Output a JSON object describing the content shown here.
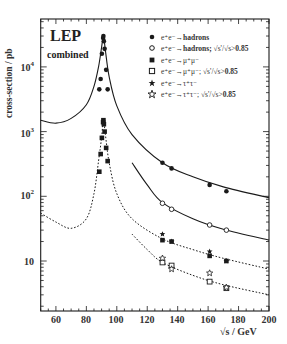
{
  "chart_data": {
    "type": "scatter",
    "title": "LEP",
    "subtitle": "combined",
    "xlabel": "√s / GeV",
    "ylabel": "cross-section / pb",
    "xlim": [
      50,
      200
    ],
    "ylim": [
      2,
      25000
    ],
    "yscale": "log",
    "x_ticks": [
      60,
      80,
      100,
      120,
      140,
      160,
      180,
      200
    ],
    "y_ticks": [
      "10",
      "10^2",
      "10^3",
      "10^4"
    ],
    "grid": false,
    "legend_position": "upper right",
    "legend": [
      {
        "marker": "filled-circle",
        "label": "e⁺e⁻→hadrons"
      },
      {
        "marker": "open-circle",
        "label": "e⁺e⁻→hadrons; √(s'/s)>0.85"
      },
      {
        "marker": "filled-square",
        "label": "e⁺e⁻→μ⁺μ⁻"
      },
      {
        "marker": "open-square",
        "label": "e⁺e⁻→μ⁺μ⁻; √(s'/s)>0.85"
      },
      {
        "marker": "filled-star",
        "label": "e⁺e⁻→τ⁺τ⁻"
      },
      {
        "marker": "open-star",
        "label": "e⁺e⁻→τ⁺τ⁻; √(s'/s)>0.85"
      }
    ],
    "series": [
      {
        "name": "e+e- -> hadrons",
        "marker": "filled-circle",
        "x": [
          88.5,
          89.4,
          90.2,
          91.0,
          91.2,
          91.5,
          92.0,
          93.0,
          94.0,
          130,
          136,
          161,
          172
        ],
        "y": [
          4500,
          6500,
          16000,
          28000,
          30000,
          25000,
          19000,
          9000,
          4500,
          330,
          270,
          150,
          120
        ]
      },
      {
        "name": "e+e- -> hadrons; sqrt(s'/s)>0.85",
        "marker": "open-circle",
        "x": [
          130,
          136,
          161,
          172
        ],
        "y": [
          78,
          63,
          36,
          30
        ]
      },
      {
        "name": "e+e- -> mu+mu-",
        "marker": "filled-square",
        "x": [
          88.5,
          89.4,
          90.2,
          91.0,
          91.2,
          91.5,
          92.0,
          93.0,
          94.0,
          130,
          136,
          161,
          172
        ],
        "y": [
          240,
          450,
          800,
          1400,
          1500,
          1300,
          1000,
          560,
          350,
          21,
          20,
          12,
          10
        ]
      },
      {
        "name": "e+e- -> mu+mu-; sqrt(s'/s)>0.85",
        "marker": "open-square",
        "x": [
          130,
          136,
          161,
          172
        ],
        "y": [
          9.5,
          8.5,
          4.8,
          3.8
        ]
      },
      {
        "name": "e+e- -> tau+tau-",
        "marker": "filled-star",
        "x": [
          130,
          136,
          161,
          172
        ],
        "y": [
          26,
          20,
          14,
          10
        ]
      },
      {
        "name": "e+e- -> tau+tau-; sqrt(s'/s)>0.85",
        "marker": "open-star",
        "x": [
          130,
          136,
          161,
          172
        ],
        "y": [
          11,
          7.5,
          6.5,
          3.9
        ]
      }
    ],
    "curves": [
      {
        "name": "SM hadrons",
        "style": "solid",
        "x": [
          50,
          60,
          70,
          80,
          85,
          88,
          90,
          91.2,
          92.5,
          95,
          100,
          110,
          130,
          150,
          170,
          200
        ],
        "y": [
          1500,
          1350,
          1600,
          2600,
          5000,
          10000,
          20000,
          30500,
          18000,
          7000,
          2500,
          900,
          330,
          200,
          140,
          95
        ]
      },
      {
        "name": "SM hadrons sqrt(s'/s)>0.85",
        "style": "solid",
        "x": [
          110,
          120,
          130,
          150,
          170,
          200
        ],
        "y": [
          330,
          150,
          80,
          45,
          31,
          21
        ]
      },
      {
        "name": "SM mu+mu-",
        "style": "dotted",
        "x": [
          50,
          60,
          70,
          80,
          85,
          88,
          90,
          91.2,
          92.5,
          95,
          100,
          110,
          130,
          150,
          170,
          200
        ],
        "y": [
          55,
          40,
          32,
          45,
          110,
          350,
          800,
          1500,
          900,
          330,
          110,
          45,
          22,
          15,
          11,
          7.5
        ]
      },
      {
        "name": "SM mu+mu- sqrt(s'/s)>0.85",
        "style": "dotted",
        "x": [
          110,
          120,
          130,
          150,
          170,
          200
        ],
        "y": [
          26,
          15,
          9.5,
          6,
          4.3,
          3
        ]
      }
    ]
  },
  "labels": {
    "title": "LEP",
    "subtitle": "combined",
    "ylabel": "cross-section / pb",
    "xlabel": "√s / GeV",
    "yticks": [
      {
        "base": "10",
        "exp": "4"
      },
      {
        "base": "10",
        "exp": "3"
      },
      {
        "base": "10",
        "exp": "2"
      },
      {
        "base": "10",
        "exp": ""
      }
    ],
    "xticks": [
      "60",
      "80",
      "100",
      "120",
      "140",
      "160",
      "180",
      "200"
    ],
    "legend": [
      {
        "pre": "e⁺e⁻→",
        "bold": "hadrons",
        "post": ""
      },
      {
        "pre": "e⁺e⁻→",
        "bold": "hadrons;",
        "post": " √s'/√s>",
        "bold2": "0.85"
      },
      {
        "pre": "e⁺e⁻→μ⁺μ⁻",
        "bold": "",
        "post": ""
      },
      {
        "pre": "e⁺e⁻→μ⁺μ⁻; √s'/√s>",
        "bold": "0.85",
        "post": ""
      },
      {
        "pre": "e⁺e⁻→τ⁺τ⁻",
        "bold": "",
        "post": ""
      },
      {
        "pre": "e⁺e⁻→τ⁺τ⁻; √s'/√s>",
        "bold": "0.85",
        "post": ""
      }
    ]
  },
  "colors": {
    "ink": "#1a1a1a",
    "background": "#ffffff"
  }
}
